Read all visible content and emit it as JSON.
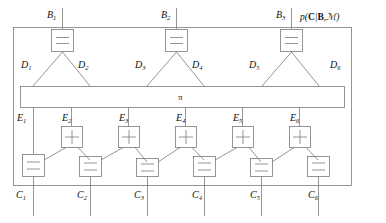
{
  "figure": {
    "type": "factor-graph-diagram",
    "outer_label": {
      "text": "p(C|B,M)",
      "parts": {
        "p": "p",
        "open": "(",
        "C": "C",
        "bar": "|",
        "B": "B",
        "comma": ",",
        "M": "ℳ",
        "close": ")"
      }
    },
    "pi_node": {
      "label": "π",
      "name": "permutation-node"
    },
    "line_color": "#7a7a7a",
    "text_color": "#1a1a1a",
    "background": "#ffffff"
  },
  "b_nodes": [
    {
      "id": "B1",
      "base": "B",
      "sub": "1",
      "glyph": "equals",
      "x": 51,
      "y": 29
    },
    {
      "id": "B2",
      "base": "B",
      "sub": "2",
      "glyph": "equals",
      "x": 165,
      "y": 29
    },
    {
      "id": "B3",
      "base": "B",
      "sub": "3",
      "glyph": "equals",
      "x": 280,
      "y": 29
    }
  ],
  "d_labels": [
    {
      "id": "D1",
      "base": "D",
      "sub": "1",
      "x": 21,
      "y": 62
    },
    {
      "id": "D2",
      "base": "D",
      "sub": "2",
      "x": 78,
      "y": 62
    },
    {
      "id": "D3",
      "base": "D",
      "sub": "3",
      "x": 135,
      "y": 62
    },
    {
      "id": "D4",
      "base": "D",
      "sub": "4",
      "x": 192,
      "y": 62
    },
    {
      "id": "D5",
      "base": "D",
      "sub": "5",
      "x": 249,
      "y": 62
    },
    {
      "id": "D6",
      "base": "D",
      "sub": "6",
      "x": 330,
      "y": 62
    }
  ],
  "e_labels": [
    {
      "id": "E1",
      "base": "E",
      "sub": "1",
      "x": 17,
      "y": 116
    },
    {
      "id": "E2",
      "base": "E",
      "sub": "2",
      "x": 62,
      "y": 116
    },
    {
      "id": "E3",
      "base": "E",
      "sub": "3",
      "x": 119,
      "y": 116
    },
    {
      "id": "E4",
      "base": "E",
      "sub": "4",
      "x": 176,
      "y": 116
    },
    {
      "id": "E5",
      "base": "E",
      "sub": "5",
      "x": 233,
      "y": 116
    },
    {
      "id": "E6",
      "base": "E",
      "sub": "6",
      "x": 290,
      "y": 116
    }
  ],
  "e_nodes": [
    {
      "id": "E2",
      "glyph": "plus",
      "x": 61,
      "y": 126
    },
    {
      "id": "E3",
      "glyph": "plus",
      "x": 118,
      "y": 126
    },
    {
      "id": "E4",
      "glyph": "plus",
      "x": 175,
      "y": 126
    },
    {
      "id": "E5",
      "glyph": "plus",
      "x": 232,
      "y": 126
    },
    {
      "id": "E6",
      "glyph": "plus",
      "x": 289,
      "y": 126
    }
  ],
  "c_nodes": [
    {
      "id": "C1",
      "glyph": "equals",
      "x": 22,
      "y": 154
    },
    {
      "id": "C2",
      "glyph": "equals",
      "x": 79,
      "y": 156
    },
    {
      "id": "C3",
      "glyph": "equals",
      "x": 136,
      "y": 158
    },
    {
      "id": "C4",
      "glyph": "equals",
      "x": 193,
      "y": 156
    },
    {
      "id": "C5",
      "glyph": "equals",
      "x": 250,
      "y": 158
    },
    {
      "id": "C6",
      "glyph": "equals",
      "x": 307,
      "y": 156
    }
  ],
  "c_labels": [
    {
      "id": "C1",
      "base": "C",
      "sub": "1",
      "x": 16,
      "y": 192
    },
    {
      "id": "C2",
      "base": "C",
      "sub": "2",
      "x": 77,
      "y": 192
    },
    {
      "id": "C3",
      "base": "C",
      "sub": "3",
      "x": 134,
      "y": 192
    },
    {
      "id": "C4",
      "base": "C",
      "sub": "4",
      "x": 192,
      "y": 192
    },
    {
      "id": "C5",
      "base": "C",
      "sub": "5",
      "x": 250,
      "y": 192
    },
    {
      "id": "C6",
      "base": "C",
      "sub": "6",
      "x": 308,
      "y": 192
    }
  ]
}
